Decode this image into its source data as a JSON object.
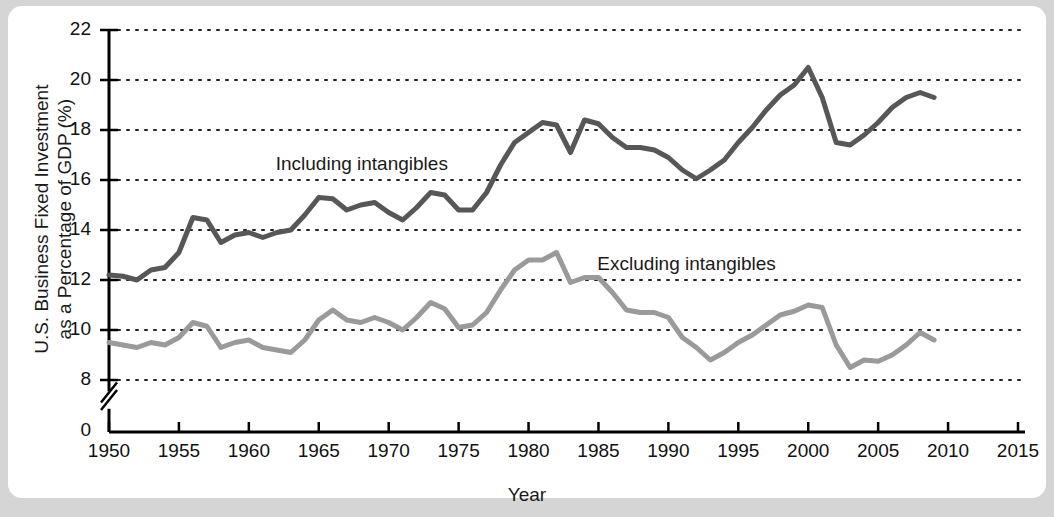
{
  "chart_data": {
    "type": "line",
    "title": "",
    "xlabel": "Year",
    "ylabel": "U.S. Business Fixed Investment as a Percentage of GDP (%)",
    "ylabel_line1": "U.S. Business Fixed Investment",
    "ylabel_line2": "as a Percentage of GDP (%)",
    "xlim": [
      1950,
      2015
    ],
    "ylim": [
      7.0,
      22.0
    ],
    "y_axis_break": true,
    "y_zero_label": "0",
    "grid": "dotted-horizontal",
    "legend_position": "inline-annotations",
    "xticks": [
      1950,
      1955,
      1960,
      1965,
      1970,
      1975,
      1980,
      1985,
      1990,
      1995,
      2000,
      2005,
      2010,
      2015
    ],
    "xtick_labels": [
      "1950",
      "1955",
      "1960",
      "1965",
      "1970",
      "1975",
      "1980",
      "1985",
      "1990",
      "1995",
      "2000",
      "2005",
      "2010",
      "2015"
    ],
    "yticks": [
      8,
      10,
      12,
      14,
      16,
      18,
      20,
      22
    ],
    "ytick_labels": [
      "8",
      "10",
      "12",
      "14",
      "16",
      "18",
      "20",
      "22"
    ],
    "x": [
      1950,
      1951,
      1952,
      1953,
      1954,
      1955,
      1956,
      1957,
      1958,
      1959,
      1960,
      1961,
      1962,
      1963,
      1964,
      1965,
      1966,
      1967,
      1968,
      1969,
      1970,
      1971,
      1972,
      1973,
      1974,
      1975,
      1976,
      1977,
      1978,
      1979,
      1980,
      1981,
      1982,
      1983,
      1984,
      1985,
      1986,
      1987,
      1988,
      1989,
      1990,
      1991,
      1992,
      1993,
      1994,
      1995,
      1996,
      1997,
      1998,
      1999,
      2000,
      2001,
      2002,
      2003,
      2004,
      2005,
      2006,
      2007,
      2008,
      2009
    ],
    "series": [
      {
        "name": "Including intangibles",
        "color": "#575757",
        "values": [
          12.2,
          12.15,
          12.0,
          12.4,
          12.5,
          13.1,
          14.5,
          14.4,
          13.5,
          13.8,
          13.9,
          13.7,
          13.9,
          14.0,
          14.6,
          15.3,
          15.25,
          14.8,
          15.0,
          15.1,
          14.7,
          14.4,
          14.9,
          15.5,
          15.4,
          14.8,
          14.8,
          15.5,
          16.6,
          17.5,
          17.9,
          18.3,
          18.2,
          17.1,
          18.4,
          18.25,
          17.7,
          17.3,
          17.3,
          17.2,
          16.9,
          16.4,
          16.05,
          16.4,
          16.8,
          17.5,
          18.1,
          18.8,
          19.4,
          19.8,
          20.5,
          19.3,
          17.5,
          17.4,
          17.8,
          18.3,
          18.9,
          19.3,
          19.5,
          19.3
        ]
      },
      {
        "name": "Excluding intangibles",
        "color": "#9a9a9a",
        "values": [
          9.5,
          9.4,
          9.3,
          9.5,
          9.4,
          9.7,
          10.3,
          10.15,
          9.3,
          9.5,
          9.6,
          9.3,
          9.2,
          9.1,
          9.6,
          10.4,
          10.8,
          10.4,
          10.3,
          10.5,
          10.3,
          10.0,
          10.5,
          11.1,
          10.85,
          10.1,
          10.2,
          10.7,
          11.6,
          12.4,
          12.8,
          12.8,
          13.1,
          11.9,
          12.1,
          12.1,
          11.5,
          10.8,
          10.7,
          10.7,
          10.5,
          9.7,
          9.3,
          8.8,
          9.1,
          9.5,
          9.8,
          10.2,
          10.6,
          10.75,
          11.0,
          10.9,
          9.4,
          8.5,
          8.8,
          8.75,
          9.0,
          9.4,
          9.9,
          9.6
        ]
      }
    ],
    "annotations": [
      {
        "text": "Including intangibles",
        "x": 1968,
        "y": 16.6
      },
      {
        "text": "Excluding intangibles",
        "x": 1991,
        "y": 12.6
      }
    ]
  }
}
